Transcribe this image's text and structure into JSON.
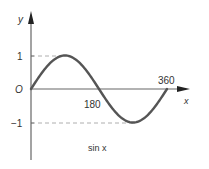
{
  "chart_data": {
    "type": "line",
    "title": "",
    "annotation": "sin x",
    "xlabel": "x",
    "ylabel": "y",
    "origin_label": "O",
    "x_ticks": [
      {
        "value": 180,
        "label": "180"
      },
      {
        "value": 360,
        "label": "360"
      }
    ],
    "y_ticks": [
      {
        "value": 1,
        "label": "1"
      },
      {
        "value": -1,
        "label": "−1"
      }
    ],
    "xlim": [
      0,
      380
    ],
    "ylim": [
      -2,
      2
    ],
    "grid": false,
    "reference_lines": [
      {
        "type": "dashed",
        "y": 1,
        "x_range": [
          0,
          90
        ]
      },
      {
        "type": "dashed",
        "y": -1,
        "x_range": [
          0,
          270
        ]
      }
    ],
    "series": [
      {
        "name": "sin x",
        "x": [
          0,
          30,
          60,
          90,
          120,
          150,
          180,
          210,
          240,
          270,
          300,
          330,
          360
        ],
        "values": [
          0,
          0.5,
          0.866,
          1,
          0.866,
          0.5,
          0,
          -0.5,
          -0.866,
          -1,
          -0.866,
          -0.5,
          0
        ]
      }
    ],
    "colors": {
      "curve": "#555555",
      "axes": "#666666",
      "dashes": "#999999"
    }
  }
}
